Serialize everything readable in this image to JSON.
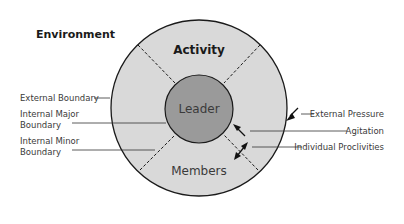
{
  "diagram": {
    "environment_label": "Environment",
    "activity_label": "Activity",
    "leader_label": "Leader",
    "members_label": "Members",
    "left_labels": {
      "external_boundary": "External Boundary",
      "internal_major_line1": "Internal Major",
      "internal_major_line2": "Boundary",
      "internal_minor_line1": "Internal Minor",
      "internal_minor_line2": "Boundary"
    },
    "right_labels": {
      "external_pressure": "External Pressure",
      "agitation": "Agitation",
      "individual_proclivities": "Individual Proclivities"
    },
    "colors": {
      "outer_ring": "#d9d9d9",
      "leader_circle": "#9a9a9a",
      "stroke": "#1a1a1a"
    }
  }
}
